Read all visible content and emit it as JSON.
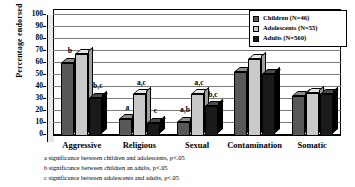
{
  "chart_data": {
    "type": "bar",
    "title": "",
    "xlabel": "",
    "ylabel": "Percentage endorsed",
    "ylim": [
      0,
      100
    ],
    "yticks": [
      0,
      10,
      20,
      30,
      40,
      50,
      60,
      70,
      80,
      90,
      100
    ],
    "grid": true,
    "legend_position": "top-right",
    "categories": [
      "Aggressive",
      "Religious",
      "Sexual",
      "Contamination",
      "Somatic"
    ],
    "series": [
      {
        "name": "Children (N=46)",
        "values": [
          61,
          14,
          12,
          53,
          33
        ],
        "color": "#585858"
      },
      {
        "name": "Adolescents (N=55)",
        "values": [
          68,
          35,
          35,
          64,
          36
        ],
        "color": "#c9c9c9"
      },
      {
        "name": "Adults (N=560)",
        "values": [
          32,
          11,
          25,
          52,
          35
        ],
        "color": "#1a1a1a"
      }
    ],
    "annotations": [
      {
        "category": "Aggressive",
        "series": "Children (N=46)",
        "label": "b"
      },
      {
        "category": "Aggressive",
        "series": "Adults (N=560)",
        "label": "b,c"
      },
      {
        "category": "Religious",
        "series": "Children (N=46)",
        "label": "a"
      },
      {
        "category": "Religious",
        "series": "Adolescents (N=55)",
        "label": "a,c"
      },
      {
        "category": "Religious",
        "series": "Adults (N=560)",
        "label": "c"
      },
      {
        "category": "Sexual",
        "series": "Children (N=46)",
        "label": "a,b"
      },
      {
        "category": "Sexual",
        "series": "Adolescents (N=55)",
        "label": "a,c"
      },
      {
        "category": "Sexual",
        "series": "Adults (N=560)",
        "label": "b,c"
      }
    ],
    "footnotes": [
      "a significance between children and adolescents, p<.05",
      "b significance between children an adults, p<.05",
      "c significance between adolescents and adults, p<.05"
    ]
  },
  "axis": {
    "y_title": "Percentage endorsed",
    "y_labels": [
      "100",
      "90",
      "80",
      "70",
      "60",
      "50",
      "40",
      "30",
      "20",
      "10",
      "0"
    ]
  },
  "legend": {
    "items": [
      {
        "label": "Children (N=46)"
      },
      {
        "label": "Adolescents (N=55)"
      },
      {
        "label": "Adults (N=560)"
      }
    ]
  },
  "footnotes": {
    "lines": [
      "a significance between children and adolescents, p<.05",
      "b significance between children an adults, p<.05",
      "c significance between adolescents and adults, p<.05"
    ]
  },
  "categories": {
    "labels": [
      "Aggressive",
      "Religious",
      "Sexual",
      "Contamination",
      "Somatic"
    ]
  }
}
